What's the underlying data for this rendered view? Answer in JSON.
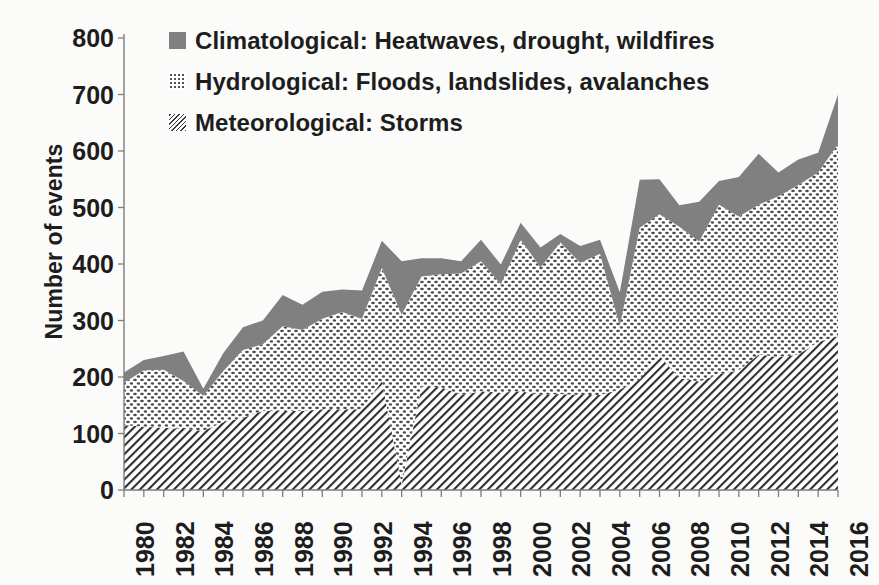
{
  "chart_data": {
    "type": "area",
    "stacked": true,
    "title": "",
    "subtitle": "",
    "xlabel": "",
    "ylabel": "Number of events",
    "ylim": [
      0,
      800
    ],
    "ytick_labels": [
      "0",
      "100",
      "200",
      "300",
      "400",
      "500",
      "600",
      "700",
      "800"
    ],
    "ytick_values": [
      0,
      100,
      200,
      300,
      400,
      500,
      600,
      700,
      800
    ],
    "grid": false,
    "legend_position": "top-left",
    "xlim": [
      1980,
      2016
    ],
    "xtick_step": 2,
    "x": [
      1980,
      1981,
      1982,
      1983,
      1984,
      1985,
      1986,
      1987,
      1988,
      1989,
      1990,
      1991,
      1992,
      1993,
      1994,
      1995,
      1996,
      1997,
      1998,
      1999,
      2000,
      2001,
      2002,
      2003,
      2004,
      2005,
      2006,
      2007,
      2008,
      2009,
      2010,
      2011,
      2012,
      2013,
      2014,
      2015,
      2016
    ],
    "xtick_labels": [
      "1980",
      "1982",
      "1984",
      "1986",
      "1988",
      "1990",
      "1992",
      "1994",
      "1996",
      "1998",
      "2000",
      "2002",
      "2004",
      "2006",
      "2008",
      "2010",
      "2012",
      "2014",
      "2016"
    ],
    "series": [
      {
        "name": "Meteorological: Storms",
        "legend_label": "Meteorological: Storms",
        "description": "Storms",
        "pattern": "diagonal-hatch",
        "color": "#3a3a3a",
        "values": [
          115,
          112,
          110,
          108,
          105,
          120,
          128,
          140,
          140,
          140,
          143,
          143,
          143,
          193,
          10,
          183,
          182,
          168,
          175,
          172,
          175,
          168,
          170,
          168,
          168,
          178,
          196,
          238,
          198,
          192,
          205,
          212,
          240,
          235,
          240,
          262,
          272
        ]
      },
      {
        "name": "Hydrological: Floods, landslides, avalanches",
        "legend_label": "Hydrological: Floods, landslides, avalanches",
        "description": "Floods, landslides, avalanches",
        "pattern": "dots",
        "color": "#9a9a9a",
        "values": [
          75,
          100,
          103,
          85,
          62,
          90,
          120,
          118,
          150,
          143,
          160,
          172,
          160,
          200,
          300,
          195,
          200,
          215,
          230,
          192,
          268,
          226,
          268,
          234,
          250,
          112,
          268,
          250,
          268,
          248,
          300,
          272,
          265,
          285,
          300,
          300,
          340
        ]
      },
      {
        "name": "Climatological: Heatwaves, drought, wildfires",
        "legend_label": "Climatological: Heatwaves, drought, wildfires",
        "description": "Heatwaves, drought, wildfires",
        "pattern": "solid",
        "color": "#808080",
        "values": [
          18,
          18,
          24,
          52,
          12,
          32,
          40,
          42,
          55,
          45,
          48,
          40,
          50,
          48,
          95,
          32,
          28,
          22,
          38,
          35,
          30,
          35,
          15,
          30,
          25,
          60,
          85,
          62,
          38,
          70,
          42,
          70,
          90,
          42,
          45,
          35,
          88
        ]
      }
    ],
    "totals": [
      208,
      230,
      237,
      245,
      179,
      242,
      288,
      300,
      345,
      328,
      351,
      355,
      353,
      441,
      405,
      410,
      410,
      405,
      443,
      399,
      473,
      429,
      453,
      432,
      443,
      350,
      549,
      550,
      504,
      510,
      547,
      554,
      595,
      562,
      585,
      597,
      700
    ]
  },
  "legend": {
    "items": [
      {
        "label": "Climatological: Heatwaves, drought, wildfires",
        "swatch": "solid-square-icon"
      },
      {
        "label": "Hydrological: Floods, landslides, avalanches",
        "swatch": "dotted-square-icon"
      },
      {
        "label": "Meteorological: Storms",
        "swatch": "hatched-square-icon"
      }
    ]
  },
  "colors": {
    "background": "#fbfbf9",
    "axis": "#7d7d7d",
    "text": "#1d1d1d",
    "climatological": "#808080",
    "hydrological": "#9a9a9a",
    "meteorological": "#3a3a3a"
  }
}
